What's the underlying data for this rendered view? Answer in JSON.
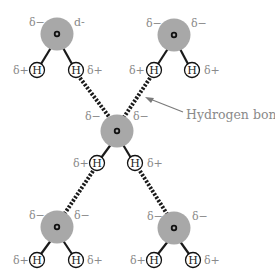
{
  "diagram": {
    "colors": {
      "oxygen_fill": "#a8a8a8",
      "bond": "#1a1a1a",
      "label": "#8a8a8a",
      "arrow": "#7a7a7a"
    },
    "annotation": {
      "label": "Hydrogen bond"
    },
    "molecules": [
      {
        "id": "top-left",
        "o": [
          57,
          34
        ],
        "h": [
          [
            37,
            70
          ],
          [
            76,
            70
          ]
        ],
        "neg_labels": [
          "δ−",
          "d-"
        ],
        "pos_labels": [
          "δ+",
          "δ+"
        ],
        "h_label": "H"
      },
      {
        "id": "top-right",
        "o": [
          174,
          35
        ],
        "h": [
          [
            154,
            70
          ],
          [
            192,
            70
          ]
        ],
        "neg_labels": [
          "δ−",
          "δ−"
        ],
        "pos_labels": [
          "δ+",
          "δ+"
        ],
        "h_label": "H"
      },
      {
        "id": "center",
        "o": [
          117,
          131
        ],
        "h": [
          [
            97,
            163
          ],
          [
            135,
            163
          ]
        ],
        "neg_labels": [
          "δ−",
          "δ−"
        ],
        "pos_labels": [
          "δ+",
          "δ+"
        ],
        "h_label": "H"
      },
      {
        "id": "bottom-left",
        "o": [
          57,
          227
        ],
        "h": [
          [
            37,
            260
          ],
          [
            76,
            260
          ]
        ],
        "neg_labels": [
          "δ−",
          "δ−"
        ],
        "pos_labels": [
          "δ+",
          "δ+"
        ],
        "h_label": "H"
      },
      {
        "id": "bottom-right",
        "o": [
          174,
          228
        ],
        "h": [
          [
            154,
            260
          ],
          [
            193,
            260
          ]
        ],
        "neg_labels": [
          "δ−",
          "δ−"
        ],
        "pos_labels": [
          "δ+",
          "δ+"
        ],
        "h_label": "H"
      }
    ],
    "hydrogen_bonds": [
      {
        "from": "top-left H right",
        "to": "center O"
      },
      {
        "from": "top-right H left",
        "to": "center O"
      },
      {
        "from": "center H left",
        "to": "bottom-left O"
      },
      {
        "from": "center H right",
        "to": "bottom-right O"
      }
    ]
  }
}
